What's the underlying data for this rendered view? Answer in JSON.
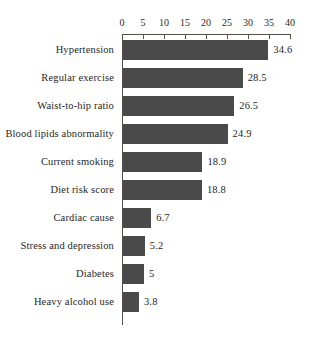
{
  "chart_data": {
    "type": "bar",
    "orientation": "horizontal",
    "title": "",
    "subtitle": "",
    "xlabel": "",
    "ylabel": "",
    "xlim": [
      0,
      40
    ],
    "xticks": [
      0,
      5,
      10,
      15,
      20,
      25,
      30,
      35,
      40
    ],
    "xtick_labels": [
      "0",
      "5",
      "10",
      "15",
      "20",
      "25",
      "30",
      "35",
      "40"
    ],
    "axis_position": "top",
    "grid": false,
    "legend": null,
    "bar_color": "#4a4a4a",
    "axis_color": "#55504c",
    "background_color": "#ffffff",
    "categories": [
      "Hypertension",
      "Regular exercise",
      "Waist-to-hip ratio",
      "Blood lipids abnormality",
      "Current smoking",
      "Diet risk score",
      "Cardiac cause",
      "Stress and depression",
      "Diabetes",
      "Heavy alcohol use"
    ],
    "values": [
      34.6,
      28.5,
      26.5,
      24.9,
      18.9,
      18.8,
      6.7,
      5.2,
      5,
      3.8
    ],
    "value_labels": [
      "34.6",
      "28.5",
      "26.5",
      "24.9",
      "18.9",
      "18.8",
      "6.7",
      "5.2",
      "5",
      "3.8"
    ]
  }
}
